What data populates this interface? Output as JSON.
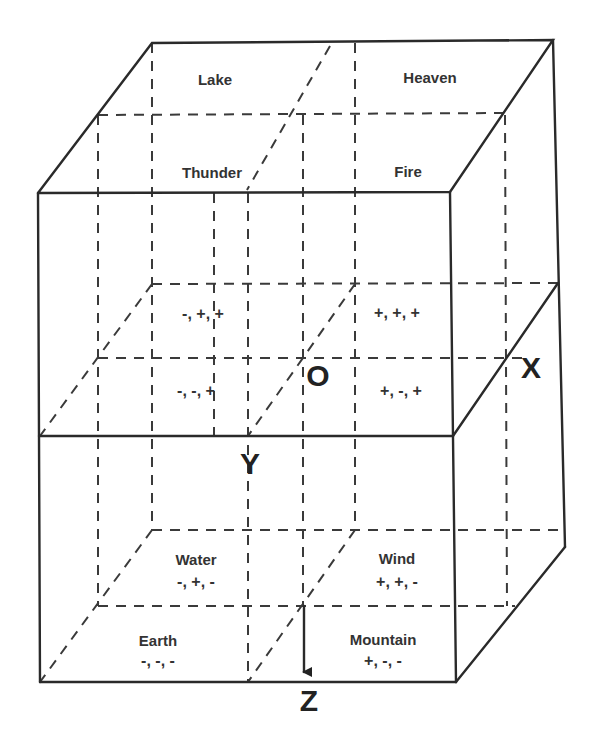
{
  "diagram": {
    "type": "3d-cube-octants",
    "axes": {
      "x": "X",
      "y": "Y",
      "z": "Z",
      "origin": "O"
    },
    "top_face": {
      "back_left": "Lake",
      "back_right": "Heaven",
      "front_left": "Thunder",
      "front_right": "Fire"
    },
    "middle_signs": {
      "back_left": "-, +, +",
      "back_right": "+, +, +",
      "front_left": "-, -, +",
      "front_right": "+, -, +"
    },
    "bottom_octants": [
      {
        "name": "Water",
        "signs": "-, +, -"
      },
      {
        "name": "Wind",
        "signs": "+, +, -"
      },
      {
        "name": "Earth",
        "signs": "-, -, -"
      },
      {
        "name": "Mountain",
        "signs": "+, -, -"
      }
    ]
  }
}
